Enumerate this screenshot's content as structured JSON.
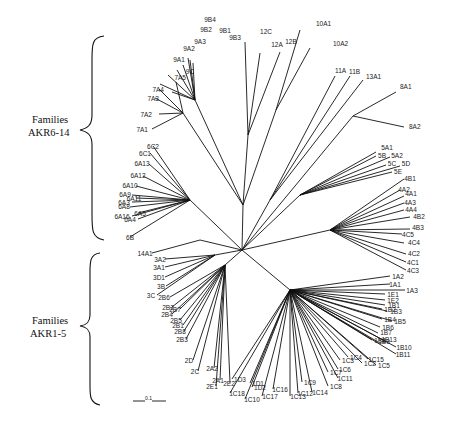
{
  "groups": [
    {
      "line1": "Families",
      "line2": "AKR6-14"
    },
    {
      "line1": "Families",
      "line2": "AKR1-5"
    }
  ],
  "scale_bar": {
    "label": "0.1"
  },
  "clades": [
    {
      "name": "AKR9",
      "leaves": [
        "9B4",
        "9B2",
        "9B1",
        "9B3",
        "9A3",
        "9A2",
        "9A1",
        "9C"
      ]
    },
    {
      "name": "AKR12",
      "leaves": [
        "12C",
        "12A",
        "12B"
      ]
    },
    {
      "name": "AKR10",
      "leaves": [
        "10A1",
        "10A2"
      ]
    },
    {
      "name": "AKR11/13",
      "leaves": [
        "11A",
        "11B",
        "13A1"
      ]
    },
    {
      "name": "AKR8",
      "leaves": [
        "8A1",
        "8A2"
      ]
    },
    {
      "name": "AKR7",
      "leaves": [
        "7A5",
        "7A4",
        "7A3",
        "7A2",
        "7A1"
      ]
    },
    {
      "name": "AKR6",
      "leaves": [
        "6C2",
        "6C1",
        "6A13",
        "6A12",
        "6A10",
        "6A9",
        "6A11",
        "6A3",
        "6A8",
        "6A5",
        "6A16",
        "6A4",
        "6B"
      ]
    },
    {
      "name": "AKR14",
      "leaves": [
        "14A1"
      ]
    },
    {
      "name": "AKR5",
      "leaves": [
        "5A1",
        "5B",
        "5A2",
        "5C",
        "5D",
        "5E"
      ]
    },
    {
      "name": "AKR4",
      "leaves": [
        "4B1",
        "4A2",
        "4A1",
        "4A3",
        "4A4",
        "4B2",
        "4B3",
        "4C5",
        "4C4",
        "4C2",
        "4C1",
        "4C3"
      ]
    },
    {
      "name": "AKR1",
      "leaves": [
        "1A2",
        "1A1",
        "1A3",
        "1E1",
        "1E2",
        "1B1",
        "1B2",
        "1B3",
        "1B4",
        "1B5",
        "1B6",
        "1B7",
        "1B8",
        "1B13",
        "1B9",
        "1B10",
        "1B11",
        "1C4",
        "1C15",
        "1C3",
        "1C2",
        "1C5",
        "1C6",
        "1C7",
        "1C11",
        "1C8",
        "1C9",
        "1C14",
        "1C12",
        "1C13",
        "1C16",
        "1C17",
        "1C10",
        "1C18",
        "1D1",
        "1D3",
        "1D2"
      ]
    },
    {
      "name": "AKR2",
      "leaves": [
        "2B6",
        "2B2",
        "2B7",
        "2B4",
        "2B5",
        "2B1",
        "2B8",
        "2B3",
        "2D",
        "2C",
        "2A2",
        "2A1",
        "2E2",
        "2E1"
      ]
    },
    {
      "name": "AKR3",
      "leaves": [
        "3A2",
        "3A1",
        "3D1",
        "3B",
        "3C"
      ]
    }
  ]
}
